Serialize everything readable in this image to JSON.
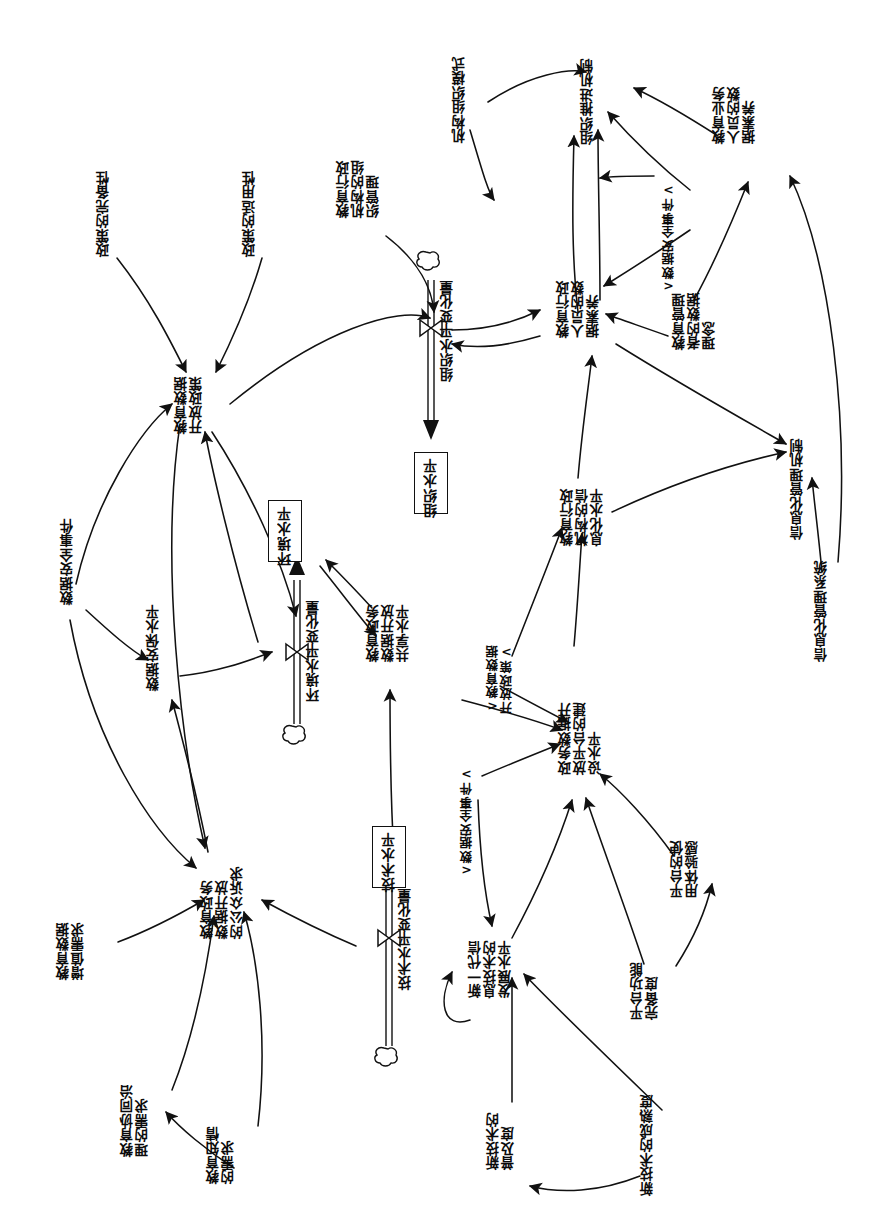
{
  "diagram": {
    "orientation": "rotated-90-ccw",
    "ink_color": "#111111",
    "background": "#ffffff"
  },
  "stocks": [
    {
      "id": "env_level",
      "label": "环境水平",
      "flow_label": "环境水平变化量"
    },
    {
      "id": "org_level",
      "label": "组织水平",
      "flow_label": "组织水平变化量"
    },
    {
      "id": "tech_level",
      "label": "技术水平",
      "flow_label": "技术水平变化量"
    }
  ],
  "variables": [
    {
      "id": "v_policy_complete",
      "label": "政策的完备性"
    },
    {
      "id": "v_policy_applic",
      "label": "政策的适用性"
    },
    {
      "id": "v_edu_open_policy",
      "label": "教育数据\n开放政策"
    },
    {
      "id": "v_data_sec_event",
      "label": "数据安全事件"
    },
    {
      "id": "v_data_sec_level",
      "label": "数据安保水平"
    },
    {
      "id": "v_public_demand",
      "label": "教育政务\n数据开放\n的公众诉求"
    },
    {
      "id": "v_value_demand",
      "label": "教育数据\n增值需求"
    },
    {
      "id": "v_coop_demand",
      "label": "教育协同治\n理的需求"
    },
    {
      "id": "v_know_demand",
      "label": "教育知情\n的需求"
    },
    {
      "id": "v_share_level",
      "label": "教育政务\n数据开放\n共享水平"
    },
    {
      "id": "v_org_model",
      "label": "机构组织模式"
    },
    {
      "id": "v_admin_org_mgmt",
      "label": "教育行政\n机构的组\n织管理"
    },
    {
      "id": "v_org_promote",
      "label": "组织推进机制"
    },
    {
      "id": "v_admin_literacy",
      "label": "教育行政\n人员的数\n据素养"
    },
    {
      "id": "v_biz_literacy",
      "label": "教育业务\n人员的数\n据素养"
    },
    {
      "id": "v_mgr_concept",
      "label": "教育管理\n者的数据\n理念"
    },
    {
      "id": "v_info_level",
      "label": "教育行政\n机构的信\n息化水平"
    },
    {
      "id": "v_info_mgmt_mech",
      "label": "信息化管理机制"
    },
    {
      "id": "v_info_mgmt_sys",
      "label": "信息化管理系统"
    },
    {
      "id": "v_platform_level",
      "label": "政务数据开\n放平台的建\n设水平"
    },
    {
      "id": "v_newgen_it",
      "label": "新一代信\n息技术的\n发展水平"
    },
    {
      "id": "v_new_tech_pop",
      "label": "新技术的\n普及度"
    },
    {
      "id": "v_new_tech_mature",
      "label": "新技术的成熟度"
    },
    {
      "id": "v_platform_func",
      "label": "平台功能\n完备度"
    },
    {
      "id": "v_platform_ux",
      "label": "平台的使\n用体验感"
    }
  ],
  "shadow_variables": [
    {
      "id": "s_sec_event_top",
      "label": "<数据安全事件>"
    },
    {
      "id": "s_sec_event_bot",
      "label": "<数据安全事件>"
    },
    {
      "id": "s_open_policy",
      "label": "<教育数据\n开放政策>"
    }
  ]
}
